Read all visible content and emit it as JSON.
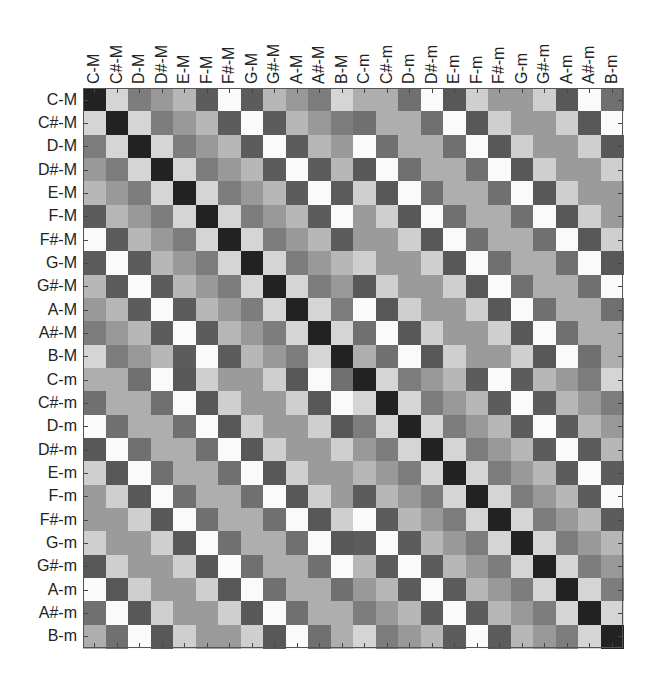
{
  "chart_data": {
    "type": "heatmap",
    "title": "",
    "xlabel": "",
    "ylabel": "",
    "x_tick_labels": [
      "C-M",
      "C#-M",
      "D-M",
      "D#-M",
      "E-M",
      "F-M",
      "F#-M",
      "G-M",
      "G#-M",
      "A-M",
      "A#-M",
      "B-M",
      "C-m",
      "C#-m",
      "D-m",
      "D#-m",
      "E-m",
      "F-m",
      "F#-m",
      "G-m",
      "G#-m",
      "A-m",
      "A#-m",
      "B-m"
    ],
    "y_tick_labels": [
      "C-M",
      "C#-M",
      "D-M",
      "D#-M",
      "E-M",
      "F-M",
      "F#-M",
      "G-M",
      "G#-M",
      "A-M",
      "A#-M",
      "B-M",
      "C-m",
      "C#-m",
      "D-m",
      "D#-m",
      "E-m",
      "F-m",
      "F#-m",
      "G-m",
      "G#-m",
      "A-m",
      "A#-m",
      "B-m"
    ],
    "colormap": "grayscale (0 = black, 1 = white)",
    "grid": false,
    "legend": "none",
    "block_patterns": {
      "major_major_offset_pattern": [
        0.0,
        0.83,
        0.42,
        0.55,
        0.69,
        0.27,
        1.0,
        0.27,
        0.69,
        0.55,
        0.42,
        0.83
      ],
      "minor_minor_offset_pattern": [
        0.0,
        0.83,
        0.42,
        0.55,
        0.69,
        0.27,
        1.0,
        0.27,
        0.69,
        0.55,
        0.42,
        0.83
      ],
      "major_minor_row0_pattern": [
        0.65,
        0.65,
        0.36,
        1.0,
        0.25,
        0.8,
        0.56,
        0.56,
        0.8,
        0.25,
        1.0,
        0.36
      ]
    },
    "note": "Value at (row i, col j) is a grayscale intensity; each 12x12 block is a circulant built by shifting its first row right by one per row."
  }
}
